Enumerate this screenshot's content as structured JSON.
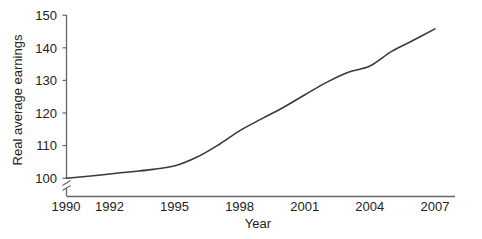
{
  "chart_data": {
    "type": "line",
    "title": "",
    "xlabel": "Year",
    "ylabel": "Real average earnings",
    "xlim": [
      1990,
      2007
    ],
    "ylim": [
      100,
      150
    ],
    "grid": false,
    "legend": "none",
    "y_axis_break": true,
    "y_axis_break_symbol": "zigzag",
    "line_color": "#3a3a3a",
    "axis_color": "#666666",
    "text_color": "#222222",
    "xticks": [
      1990,
      1992,
      1995,
      1998,
      2001,
      2004,
      2007
    ],
    "xtick_labels": [
      "1990",
      "1992",
      "1995",
      "1998",
      "2001",
      "2004",
      "2007"
    ],
    "yticks": [
      100,
      110,
      120,
      130,
      140,
      150
    ],
    "ytick_labels": [
      "100",
      "110",
      "120",
      "130",
      "140",
      "150"
    ],
    "series": [
      {
        "name": "Real average earnings",
        "x": [
          1990,
          1991,
          1992,
          1993,
          1994,
          1995,
          1996,
          1997,
          1998,
          1999,
          2000,
          2001,
          2002,
          2003,
          2004,
          2005,
          2006,
          2007
        ],
        "values": [
          100.0,
          100.6,
          101.3,
          102.0,
          102.7,
          103.8,
          106.4,
          110.2,
          114.6,
          118.2,
          121.7,
          125.6,
          129.4,
          132.5,
          134.4,
          138.9,
          142.3,
          145.8
        ]
      }
    ]
  },
  "axes": {
    "y_label": "Real average earnings",
    "x_label": "Year"
  }
}
